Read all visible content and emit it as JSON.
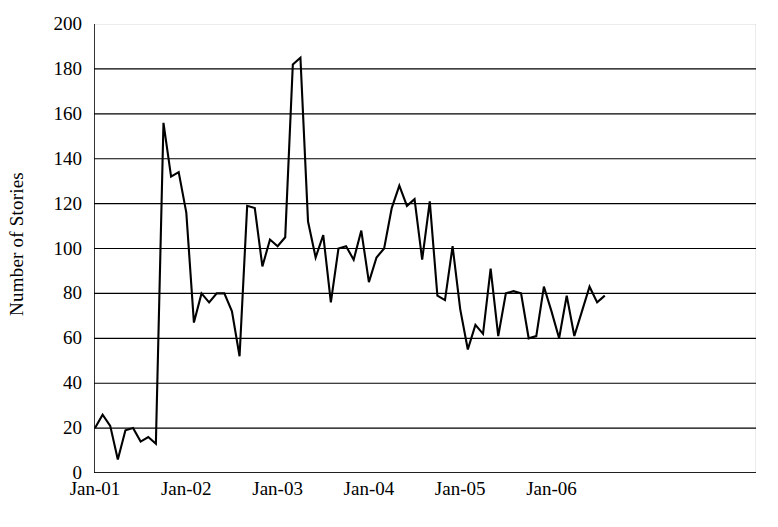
{
  "chart_data": {
    "type": "line",
    "title": "",
    "subtitle": "",
    "xlabel": "",
    "ylabel": "Number of Stories",
    "ylim": [
      0,
      200
    ],
    "ytick_values": [
      0,
      20,
      40,
      60,
      80,
      100,
      120,
      140,
      160,
      180,
      200
    ],
    "ytick_labels": [
      "0",
      "20",
      "40",
      "60",
      "80",
      "100",
      "120",
      "140",
      "160",
      "180",
      "200"
    ],
    "xtick_labels": [
      "Jan-01",
      "Jan-02",
      "Jan-03",
      "Jan-04",
      "Jan-05",
      "Jan-06"
    ],
    "xtick_indices": [
      0,
      12,
      24,
      36,
      48,
      60
    ],
    "grid": "horizontal",
    "legend": "none",
    "line_color": "#000000",
    "grid_color": "#000000",
    "axis_color": "#000000",
    "series": [
      {
        "name": "Number of Stories",
        "x": [
          "Jan-01",
          "Feb-01",
          "Mar-01",
          "Apr-01",
          "May-01",
          "Jun-01",
          "Jul-01",
          "Aug-01",
          "Sep-01",
          "Oct-01",
          "Nov-01",
          "Dec-01",
          "Jan-02",
          "Feb-02",
          "Mar-02",
          "Apr-02",
          "May-02",
          "Jun-02",
          "Jul-02",
          "Aug-02",
          "Sep-02",
          "Oct-02",
          "Nov-02",
          "Dec-02",
          "Jan-03",
          "Feb-03",
          "Mar-03",
          "Apr-03",
          "May-03",
          "Jun-03",
          "Jul-03",
          "Aug-03",
          "Sep-03",
          "Oct-03",
          "Nov-03",
          "Dec-03",
          "Jan-04",
          "Feb-04",
          "Mar-04",
          "Apr-04",
          "May-04",
          "Jun-04",
          "Jul-04",
          "Aug-04",
          "Sep-04",
          "Oct-04",
          "Nov-04",
          "Dec-04",
          "Jan-05",
          "Feb-05",
          "Mar-05",
          "Apr-05",
          "May-05",
          "Jun-05",
          "Jul-05",
          "Aug-05",
          "Sep-05",
          "Oct-05",
          "Nov-05",
          "Dec-05",
          "Jan-06",
          "Feb-06",
          "Mar-06",
          "Apr-06",
          "May-06",
          "Jun-06",
          "Jul-06",
          "Aug-06"
        ],
        "values": [
          20,
          26,
          21,
          6,
          19,
          20,
          14,
          16,
          13,
          156,
          132,
          134,
          116,
          67,
          80,
          76,
          80,
          80,
          72,
          52,
          119,
          118,
          92,
          104,
          101,
          105,
          182,
          185,
          112,
          96,
          106,
          76,
          100,
          101,
          95,
          108,
          85,
          96,
          100,
          118,
          128,
          119,
          122,
          95,
          121,
          79,
          77,
          101,
          73,
          55,
          66,
          62,
          91,
          61,
          80,
          81,
          80,
          60,
          61,
          83,
          72,
          60,
          79,
          61,
          72,
          83,
          76,
          79
        ]
      }
    ],
    "annotations": [],
    "notable_points": {
      "first_spike": {
        "x": "Oct-01",
        "y": 156
      },
      "max": {
        "x": "Apr-03",
        "y": 185
      },
      "min": {
        "x": "Apr-01",
        "y": 6
      }
    }
  }
}
